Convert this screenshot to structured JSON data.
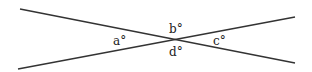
{
  "diagram": {
    "type": "intersecting-lines",
    "lines": [
      {
        "x1": 20,
        "y1": 9,
        "x2": 295,
        "y2": 63
      },
      {
        "x1": 18,
        "y1": 69,
        "x2": 295,
        "y2": 17
      }
    ],
    "labels": {
      "a": "a°",
      "b": "b°",
      "c": "c°",
      "d": "d°"
    },
    "stroke_color": "#333333"
  }
}
